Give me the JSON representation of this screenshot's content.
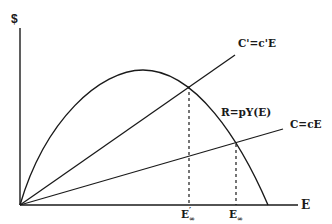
{
  "diagram": {
    "title": "",
    "type": "economic-bioeconomic-model",
    "y_axis": {
      "label": "$"
    },
    "x_axis": {
      "label": "E"
    },
    "curves": {
      "revenue": {
        "label": "R=pY(E)"
      },
      "cost_high": {
        "label": "C'=c'E"
      },
      "cost_low": {
        "label": "C=cE"
      }
    },
    "markers": {
      "e_inf_prime": {
        "label": "E",
        "sub": "∞",
        "prime": "′"
      },
      "e_inf": {
        "label": "E",
        "sub": "∞"
      }
    },
    "colors": {
      "line": "#1a1a1a",
      "background": "#ffffff"
    }
  }
}
